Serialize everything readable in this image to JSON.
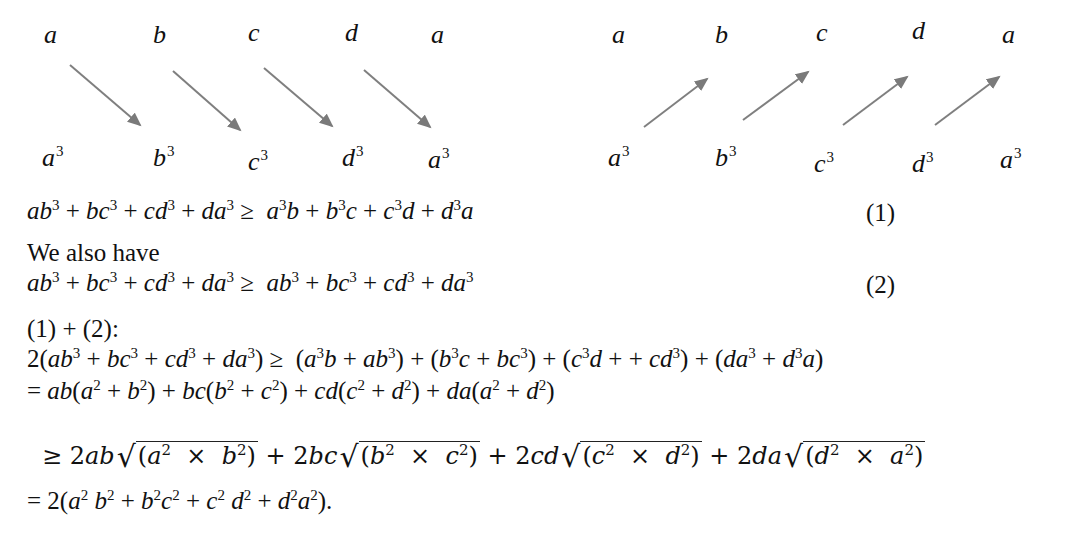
{
  "diagram_left": {
    "top_labels": [
      "a",
      "b",
      "c",
      "d",
      "a"
    ],
    "bottom_labels": [
      {
        "base": "a",
        "exp": "3"
      },
      {
        "base": "b",
        "exp": "3"
      },
      {
        "base": "c",
        "exp": "3"
      },
      {
        "base": "d",
        "exp": "3"
      },
      {
        "base": "a",
        "exp": "3"
      }
    ],
    "arrow_direction": "top-left to bottom-right",
    "arrow_color": "#7a7a7a"
  },
  "diagram_right": {
    "top_labels": [
      "a",
      "b",
      "c",
      "d",
      "a"
    ],
    "bottom_labels": [
      {
        "base": "a",
        "exp": "3"
      },
      {
        "base": "b",
        "exp": "3"
      },
      {
        "base": "c",
        "exp": "3"
      },
      {
        "base": "d",
        "exp": "3"
      },
      {
        "base": "a",
        "exp": "3"
      }
    ],
    "arrow_direction": "bottom-left to top-right",
    "arrow_color": "#6e6e6e"
  },
  "lines": {
    "eq1": "ab³ + bc³ + cd³ + da³ ≥ a³b + b³c + c³d + d³a",
    "eq1_num": "(1)",
    "text_also": "We also have",
    "eq2": "ab³ + bc³ + cd³ + da³ ≥ ab³ + bc³ + cd³ + da³",
    "eq2_num": "(2)",
    "sum_label": "(1) + (2):",
    "eq3": "2(ab³ + bc³ + cd³ + da³) ≥ (a³b + ab³) + (b³c + bc³) + (c³d + + cd³) + (da³ + d³a)",
    "eq4": "= ab(a² + b²) + bc(b² + c²) + cd(c² + d²) + da(a² + d²)",
    "eq5": "≥ 2ab√(a² × b²) + 2bc√(b² × c²) + 2cd√(c² × d²) + 2da√(d² × a²)",
    "eq6": "= 2(a² b² + b²c² + c² d² + d²a²)."
  }
}
